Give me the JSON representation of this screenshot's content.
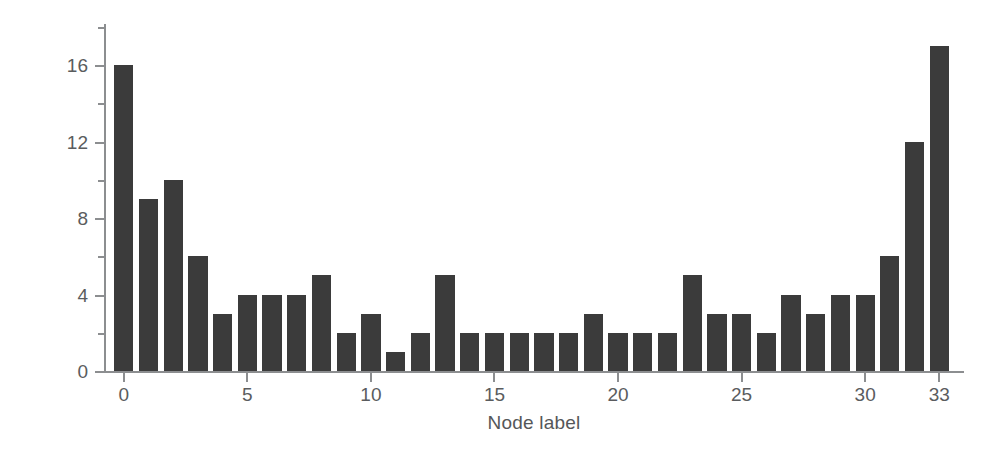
{
  "chart_data": {
    "type": "bar",
    "title": "",
    "xlabel": "Node label",
    "ylabel": "Degree",
    "categories": [
      "0",
      "1",
      "2",
      "3",
      "4",
      "5",
      "6",
      "7",
      "8",
      "9",
      "10",
      "11",
      "12",
      "13",
      "14",
      "15",
      "16",
      "17",
      "18",
      "19",
      "20",
      "21",
      "22",
      "23",
      "24",
      "25",
      "26",
      "27",
      "28",
      "29",
      "30",
      "31",
      "32",
      "33"
    ],
    "values": [
      16,
      9,
      10,
      6,
      3,
      4,
      4,
      4,
      5,
      2,
      3,
      1,
      2,
      5,
      2,
      2,
      2,
      2,
      2,
      3,
      2,
      2,
      2,
      5,
      3,
      3,
      2,
      4,
      3,
      4,
      4,
      6,
      12,
      17
    ],
    "xlim": [
      -0.8,
      34.0
    ],
    "ylim": [
      0,
      18.2
    ],
    "x_ticks": [
      0,
      5,
      10,
      15,
      20,
      25,
      30,
      33
    ],
    "x_tick_labels": [
      "0",
      "5",
      "10",
      "15",
      "20",
      "25",
      "30",
      "33"
    ],
    "y_ticks_major": [
      0,
      4,
      8,
      12,
      16
    ],
    "y_tick_labels": [
      "0",
      "4",
      "8",
      "12",
      "16"
    ],
    "y_ticks_minor": [
      2,
      6,
      10,
      14,
      18
    ],
    "grid": false,
    "legend": null,
    "bar_color": "#3b3b3b",
    "axis_color": "#8c8e90",
    "text_color": "#5a5c5e",
    "background": "#ffffff"
  }
}
